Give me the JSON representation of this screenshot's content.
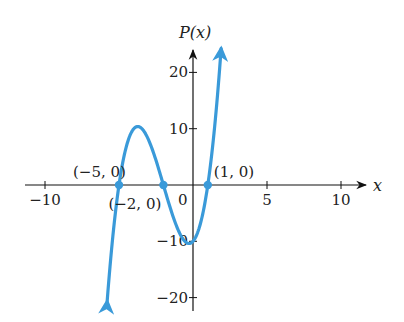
{
  "chart_data": {
    "type": "line",
    "title": "",
    "function": "P(x) = (x + 5)(x + 2)(x - 1)",
    "xlabel": "x",
    "ylabel": "P(x)",
    "xlim": [
      -11,
      11.5
    ],
    "ylim": [
      -22,
      27
    ],
    "x_ticks": [
      -10,
      5,
      10
    ],
    "x_tick_labels": [
      "−10",
      "5",
      "10"
    ],
    "origin_label": "0",
    "y_ticks": [
      20,
      10,
      -10,
      -20
    ],
    "y_tick_labels": [
      "20",
      "10",
      "−10",
      "−20"
    ],
    "grid": false,
    "series": [
      {
        "name": "P(x)",
        "color": "#3a9ad9",
        "x": [
          -5.8,
          -5.5,
          -5,
          -4.5,
          -4,
          -3.5,
          -3,
          -2.5,
          -2,
          -1.5,
          -1,
          -0.5,
          0,
          0.5,
          1,
          1.5,
          1.9
        ],
        "values": [
          -19.0,
          -7.9,
          0,
          5.0,
          10.0,
          10.1,
          8.0,
          3.8,
          0,
          -3.9,
          -8.0,
          -10.1,
          -10.0,
          -7.9,
          0,
          7.6,
          23.0
        ]
      }
    ],
    "highlighted_points": [
      {
        "x": -5,
        "y": 0,
        "label": "(−5, 0)"
      },
      {
        "x": -2,
        "y": 0,
        "label": "(−2, 0)"
      },
      {
        "x": 1,
        "y": 0,
        "label": "(1, 0)"
      }
    ],
    "curve_end_arrows": true
  }
}
